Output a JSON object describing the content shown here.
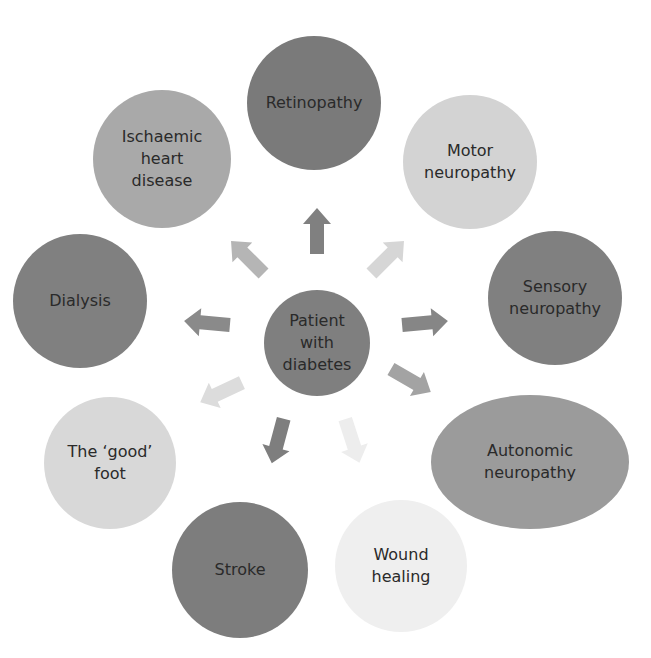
{
  "diagram": {
    "center": {
      "label": "Patient\nwith\ndiabetes",
      "color": "#7f7f7f"
    },
    "nodes": [
      {
        "id": "retinopathy",
        "label": "Retinopathy",
        "color": "#7a7a7a"
      },
      {
        "id": "motor-neuropathy",
        "label": "Motor\nneuropathy",
        "color": "#d3d3d3"
      },
      {
        "id": "sensory-neuropathy",
        "label": "Sensory\nneuropathy",
        "color": "#808080"
      },
      {
        "id": "autonomic-neuropathy",
        "label": "Autonomic\nneuropathy",
        "color": "#9b9b9b"
      },
      {
        "id": "wound-healing",
        "label": "Wound\nhealing",
        "color": "#efefef"
      },
      {
        "id": "stroke",
        "label": "Stroke",
        "color": "#7d7d7d"
      },
      {
        "id": "good-foot",
        "label": "The ‘good’\nfoot",
        "color": "#d8d8d8"
      },
      {
        "id": "dialysis",
        "label": "Dialysis",
        "color": "#808080"
      },
      {
        "id": "ischaemic-heart-disease",
        "label": "Ischaemic\nheart\ndisease",
        "color": "#a9a9a9"
      }
    ],
    "arrow_colors": {
      "retinopathy": "#808080",
      "motor-neuropathy": "#d6d6d6",
      "sensory-neuropathy": "#868686",
      "autonomic-neuropathy": "#a3a3a3",
      "wound-healing": "#ededed",
      "stroke": "#7e7e7e",
      "good-foot": "#dcdcdc",
      "dialysis": "#8a8a8a",
      "ischaemic-heart-disease": "#b5b5b5"
    }
  }
}
